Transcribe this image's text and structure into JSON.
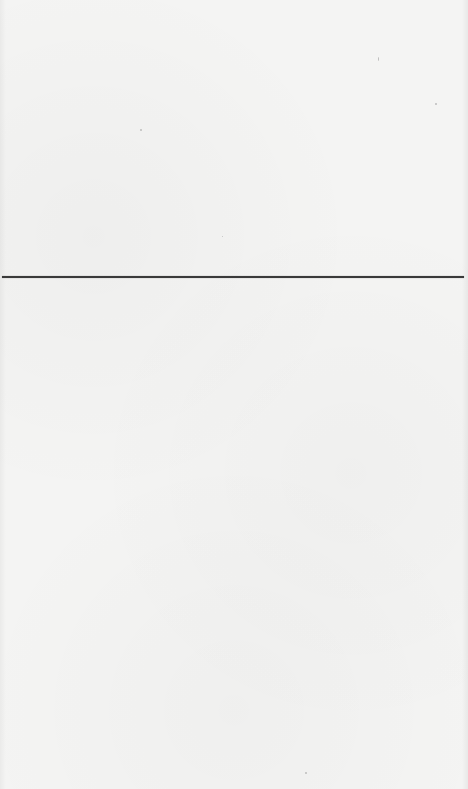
{
  "page": {
    "background_color": "#f4f4f3",
    "content": "blank"
  },
  "separator": {
    "color": "#3a3a3a",
    "y": 277,
    "x_start": 2,
    "x_end": 464,
    "thickness": 2
  }
}
